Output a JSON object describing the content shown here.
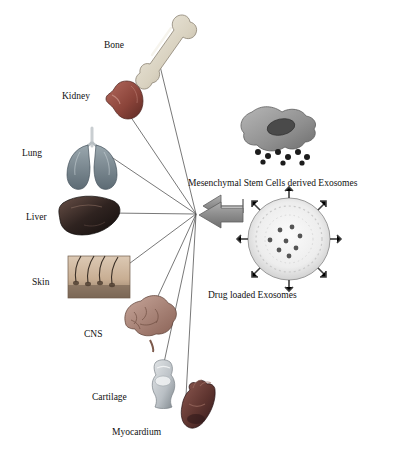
{
  "figure": {
    "background_color": "#ffffff",
    "line_color": "#555555",
    "arrow_color": "#8c8c8c"
  },
  "targets": [
    {
      "name": "bone",
      "label": "Bone",
      "label_x": 104,
      "label_y": 40,
      "icon_x": 150,
      "icon_y": 14,
      "icon_w": 42,
      "icon_h": 60,
      "line_to_x": 160,
      "line_to_y": 66
    },
    {
      "name": "kidney",
      "label": "Kidney",
      "label_x": 62,
      "label_y": 91,
      "icon_x": 104,
      "icon_y": 79,
      "icon_w": 38,
      "icon_h": 40,
      "line_to_x": 122,
      "line_to_y": 104
    },
    {
      "name": "lung",
      "label": "Lung",
      "label_x": 22,
      "label_y": 148,
      "icon_x": 66,
      "icon_y": 126,
      "icon_w": 52,
      "icon_h": 48,
      "line_to_x": 104,
      "line_to_y": 152
    },
    {
      "name": "liver",
      "label": "Liver",
      "label_x": 26,
      "label_y": 212,
      "icon_x": 62,
      "icon_y": 196,
      "icon_w": 58,
      "icon_h": 42,
      "line_to_x": 110,
      "line_to_y": 213
    },
    {
      "name": "skin",
      "label": "Skin",
      "label_x": 32,
      "label_y": 277,
      "icon_x": 68,
      "icon_y": 256,
      "icon_w": 62,
      "icon_h": 42,
      "line_to_x": 118,
      "line_to_y": 272
    },
    {
      "name": "cns",
      "label": "CNS",
      "label_x": 84,
      "label_y": 329,
      "icon_x": 120,
      "icon_y": 307,
      "icon_w": 48,
      "icon_h": 42,
      "line_to_x": 146,
      "line_to_y": 322
    },
    {
      "name": "cartilage",
      "label": "Cartilage",
      "label_x": 92,
      "label_y": 392,
      "icon_x": 148,
      "icon_y": 362,
      "icon_w": 30,
      "icon_h": 46,
      "line_to_x": 162,
      "line_to_y": 372
    },
    {
      "name": "myocardium",
      "label": "Myocardium",
      "label_x": 112,
      "label_y": 427,
      "icon_x": 178,
      "icon_y": 386,
      "icon_w": 40,
      "icon_h": 48,
      "line_to_x": 186,
      "line_to_y": 396
    }
  ],
  "hub": {
    "x": 196,
    "y": 214
  },
  "arrow": {
    "x": 203,
    "y": 204,
    "width": 40,
    "height": 22
  },
  "sources": [
    {
      "name": "msc-exosomes",
      "caption": "Mesenchymal Stem Cells derived Exosomes",
      "caption_x": 188,
      "caption_y": 178,
      "image_x": 242,
      "image_y": 105,
      "image_w": 96,
      "image_h": 66
    },
    {
      "name": "drug-loaded-exosomes",
      "caption": "Drug loaded Exosomes",
      "caption_x": 208,
      "caption_y": 290,
      "image_x": 243,
      "image_y": 196,
      "image_w": 92,
      "image_h": 86
    }
  ]
}
